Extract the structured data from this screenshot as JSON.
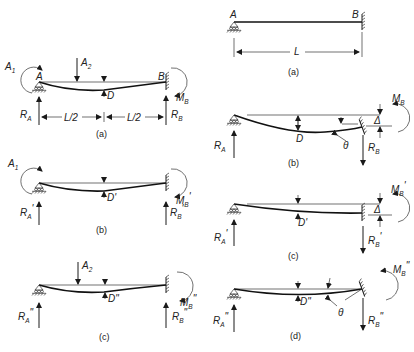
{
  "diagram_title": "Propped cantilever beam – superposition and compatibility diagrams",
  "left_column": {
    "a": {
      "caption": "(a)",
      "labels": {
        "A1": "A",
        "A1_sub": "1",
        "A2": "A",
        "A2_sub": "2",
        "A": "A",
        "B": "B",
        "D": "D",
        "MB": "M",
        "MB_sub": "B",
        "RA": "R",
        "RA_sub": "A",
        "RB": "R",
        "RB_sub": "B",
        "half1": "L/2",
        "half2": "L/2"
      }
    },
    "b": {
      "caption": "(b)",
      "labels": {
        "A1": "A",
        "A1_sub": "1",
        "D": "D'",
        "MB": "M",
        "MB_sub": "B",
        "MB_prime": "'",
        "RA": "R",
        "RA_sub": "A",
        "RA_prime": "'",
        "RB": "R",
        "RB_sub": "B",
        "RB_prime": "'"
      }
    },
    "c": {
      "caption": "(c)",
      "labels": {
        "A2": "A",
        "A2_sub": "2",
        "D": "D\"",
        "MB": "M",
        "MB_sub": "B",
        "MB_prime": "\"",
        "RA": "R",
        "RA_sub": "A",
        "RA_prime": "\"",
        "RB": "R",
        "RB_sub": "B",
        "RB_prime": "\""
      }
    }
  },
  "right_column": {
    "a": {
      "caption": "(a)",
      "labels": {
        "A": "A",
        "B": "B",
        "L": "L"
      }
    },
    "b": {
      "caption": "(b)",
      "labels": {
        "D": "D",
        "theta": "θ",
        "delta": "Δ",
        "MB": "M",
        "MB_sub": "B",
        "RA": "R",
        "RA_sub": "A",
        "RB": "R",
        "RB_sub": "B"
      }
    },
    "c": {
      "caption": "(c)",
      "labels": {
        "D": "D'",
        "delta": "Δ",
        "MB": "M",
        "MB_sub": "B",
        "MB_prime": "'",
        "RA": "R",
        "RA_sub": "A",
        "RA_prime": "'",
        "RB": "R",
        "RB_sub": "B",
        "RB_prime": "'"
      }
    },
    "d": {
      "caption": "(d)",
      "labels": {
        "D": "D\"",
        "theta": "θ",
        "MB": "M",
        "MB_sub": "B",
        "MB_prime": "\"",
        "RA": "R",
        "RA_sub": "A",
        "RA_prime": "\"",
        "RB": "R",
        "RB_sub": "B",
        "RB_prime": "\""
      }
    }
  },
  "colors": {
    "ink": "#1a1a1a",
    "background": "#ffffff"
  }
}
